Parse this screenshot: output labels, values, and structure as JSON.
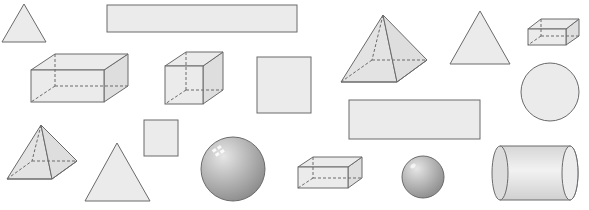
{
  "title": "Assorted 2D and 3D geometric shapes",
  "colors": {
    "fill": "#ebebeb",
    "stroke": "#6a6a6a",
    "sphere": "#b0b0b0",
    "background": "#ffffff"
  },
  "shapes": [
    {
      "id": 1,
      "type": "triangle",
      "label": "triangle (small)"
    },
    {
      "id": 2,
      "type": "rectangle",
      "label": "long rectangle"
    },
    {
      "id": 3,
      "type": "square-pyramid",
      "label": "square pyramid (large)"
    },
    {
      "id": 4,
      "type": "triangle",
      "label": "triangle"
    },
    {
      "id": 5,
      "type": "rectangular-prism",
      "label": "rectangular prism (small)"
    },
    {
      "id": 6,
      "type": "rectangular-prism",
      "label": "rectangular prism (large)"
    },
    {
      "id": 7,
      "type": "cube",
      "label": "cube"
    },
    {
      "id": 8,
      "type": "square",
      "label": "square (large)"
    },
    {
      "id": 9,
      "type": "circle",
      "label": "circle"
    },
    {
      "id": 10,
      "type": "rectangle",
      "label": "rectangle"
    },
    {
      "id": 11,
      "type": "square-pyramid",
      "label": "square pyramid (small)"
    },
    {
      "id": 12,
      "type": "square",
      "label": "square (small)"
    },
    {
      "id": 13,
      "type": "triangle",
      "label": "triangle (large)"
    },
    {
      "id": 14,
      "type": "sphere",
      "label": "sphere (large)"
    },
    {
      "id": 15,
      "type": "rectangular-prism",
      "label": "rectangular prism (flat)"
    },
    {
      "id": 16,
      "type": "sphere",
      "label": "sphere (small)"
    },
    {
      "id": 17,
      "type": "cylinder",
      "label": "cylinder"
    }
  ]
}
